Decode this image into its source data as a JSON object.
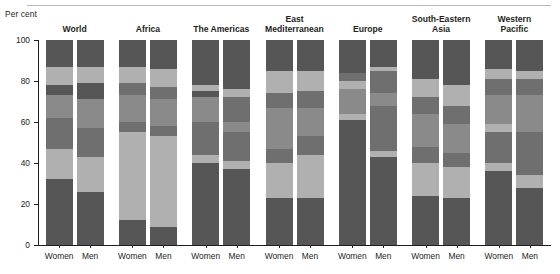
{
  "chart_data": {
    "type": "bar",
    "subtype": "stacked-column",
    "title": "",
    "xlabel": "",
    "ylabel": "Per cent",
    "ylim": [
      0,
      100
    ],
    "yticks": [
      0,
      20,
      40,
      60,
      80,
      100
    ],
    "ytick_labels": [
      "0",
      "20",
      "40",
      "60",
      "80",
      "100"
    ],
    "grid": false,
    "legend": "none",
    "colors": {
      "dark": "#565656",
      "mid_dark": "#6f6f6f",
      "mid": "#8a8a8a",
      "light": "#b0b0b0",
      "axis": "#231f20",
      "rule": "#b9b9b9",
      "background": "#ffffff"
    },
    "categories": [
      "Women",
      "Men"
    ],
    "groups": [
      {
        "name": "World",
        "bars": [
          {
            "label": "Women",
            "segments": [
              {
                "value": 32,
                "shade": "dark"
              },
              {
                "value": 15,
                "shade": "light"
              },
              {
                "value": 15,
                "shade": "mid_dark"
              },
              {
                "value": 11,
                "shade": "mid"
              },
              {
                "value": 5,
                "shade": "dark"
              },
              {
                "value": 9,
                "shade": "light"
              },
              {
                "value": 13,
                "shade": "dark"
              }
            ]
          },
          {
            "label": "Men",
            "segments": [
              {
                "value": 26,
                "shade": "dark"
              },
              {
                "value": 17,
                "shade": "light"
              },
              {
                "value": 14,
                "shade": "mid_dark"
              },
              {
                "value": 14,
                "shade": "mid"
              },
              {
                "value": 8,
                "shade": "dark"
              },
              {
                "value": 8,
                "shade": "light"
              },
              {
                "value": 13,
                "shade": "dark"
              }
            ]
          }
        ]
      },
      {
        "name": "Africa",
        "bars": [
          {
            "label": "Women",
            "segments": [
              {
                "value": 12,
                "shade": "dark"
              },
              {
                "value": 43,
                "shade": "light"
              },
              {
                "value": 5,
                "shade": "mid_dark"
              },
              {
                "value": 13,
                "shade": "mid"
              },
              {
                "value": 6,
                "shade": "mid_dark"
              },
              {
                "value": 8,
                "shade": "light"
              },
              {
                "value": 13,
                "shade": "dark"
              }
            ]
          },
          {
            "label": "Men",
            "segments": [
              {
                "value": 9,
                "shade": "dark"
              },
              {
                "value": 44,
                "shade": "light"
              },
              {
                "value": 5,
                "shade": "mid_dark"
              },
              {
                "value": 13,
                "shade": "mid"
              },
              {
                "value": 6,
                "shade": "mid_dark"
              },
              {
                "value": 9,
                "shade": "light"
              },
              {
                "value": 14,
                "shade": "dark"
              }
            ]
          }
        ]
      },
      {
        "name": "The Americas",
        "bars": [
          {
            "label": "Women",
            "segments": [
              {
                "value": 40,
                "shade": "dark"
              },
              {
                "value": 4,
                "shade": "light"
              },
              {
                "value": 16,
                "shade": "mid_dark"
              },
              {
                "value": 12,
                "shade": "mid"
              },
              {
                "value": 3,
                "shade": "dark"
              },
              {
                "value": 3,
                "shade": "light"
              },
              {
                "value": 22,
                "shade": "dark"
              }
            ]
          },
          {
            "label": "Men",
            "segments": [
              {
                "value": 37,
                "shade": "dark"
              },
              {
                "value": 4,
                "shade": "light"
              },
              {
                "value": 14,
                "shade": "mid_dark"
              },
              {
                "value": 5,
                "shade": "mid"
              },
              {
                "value": 12,
                "shade": "mid_dark"
              },
              {
                "value": 4,
                "shade": "light"
              },
              {
                "value": 24,
                "shade": "dark"
              }
            ]
          }
        ]
      },
      {
        "name": "East\nMediterranean",
        "bars": [
          {
            "label": "Women",
            "segments": [
              {
                "value": 23,
                "shade": "dark"
              },
              {
                "value": 17,
                "shade": "light"
              },
              {
                "value": 7,
                "shade": "mid_dark"
              },
              {
                "value": 20,
                "shade": "mid"
              },
              {
                "value": 7,
                "shade": "mid_dark"
              },
              {
                "value": 11,
                "shade": "light"
              },
              {
                "value": 15,
                "shade": "dark"
              }
            ]
          },
          {
            "label": "Men",
            "segments": [
              {
                "value": 23,
                "shade": "dark"
              },
              {
                "value": 21,
                "shade": "light"
              },
              {
                "value": 9,
                "shade": "mid_dark"
              },
              {
                "value": 14,
                "shade": "mid"
              },
              {
                "value": 8,
                "shade": "mid_dark"
              },
              {
                "value": 10,
                "shade": "light"
              },
              {
                "value": 15,
                "shade": "dark"
              }
            ]
          }
        ]
      },
      {
        "name": "Europe",
        "bars": [
          {
            "label": "Women",
            "segments": [
              {
                "value": 61,
                "shade": "dark"
              },
              {
                "value": 3,
                "shade": "light"
              },
              {
                "value": 12,
                "shade": "mid"
              },
              {
                "value": 4,
                "shade": "light"
              },
              {
                "value": 4,
                "shade": "mid_dark"
              },
              {
                "value": 16,
                "shade": "dark"
              }
            ]
          },
          {
            "label": "Men",
            "segments": [
              {
                "value": 43,
                "shade": "dark"
              },
              {
                "value": 3,
                "shade": "light"
              },
              {
                "value": 22,
                "shade": "mid_dark"
              },
              {
                "value": 6,
                "shade": "mid"
              },
              {
                "value": 11,
                "shade": "mid_dark"
              },
              {
                "value": 2,
                "shade": "light"
              },
              {
                "value": 13,
                "shade": "dark"
              }
            ]
          }
        ]
      },
      {
        "name": "South-Eastern\nAsia",
        "bars": [
          {
            "label": "Women",
            "segments": [
              {
                "value": 24,
                "shade": "dark"
              },
              {
                "value": 16,
                "shade": "light"
              },
              {
                "value": 8,
                "shade": "mid_dark"
              },
              {
                "value": 16,
                "shade": "mid"
              },
              {
                "value": 8,
                "shade": "mid_dark"
              },
              {
                "value": 9,
                "shade": "light"
              },
              {
                "value": 19,
                "shade": "dark"
              }
            ]
          },
          {
            "label": "Men",
            "segments": [
              {
                "value": 23,
                "shade": "dark"
              },
              {
                "value": 15,
                "shade": "light"
              },
              {
                "value": 7,
                "shade": "mid_dark"
              },
              {
                "value": 14,
                "shade": "mid"
              },
              {
                "value": 9,
                "shade": "mid_dark"
              },
              {
                "value": 10,
                "shade": "light"
              },
              {
                "value": 22,
                "shade": "dark"
              }
            ]
          }
        ]
      },
      {
        "name": "Western\nPacific",
        "bars": [
          {
            "label": "Women",
            "segments": [
              {
                "value": 36,
                "shade": "dark"
              },
              {
                "value": 4,
                "shade": "light"
              },
              {
                "value": 15,
                "shade": "mid_dark"
              },
              {
                "value": 4,
                "shade": "light"
              },
              {
                "value": 14,
                "shade": "mid"
              },
              {
                "value": 8,
                "shade": "mid_dark"
              },
              {
                "value": 5,
                "shade": "light"
              },
              {
                "value": 14,
                "shade": "dark"
              }
            ]
          },
          {
            "label": "Men",
            "segments": [
              {
                "value": 28,
                "shade": "dark"
              },
              {
                "value": 6,
                "shade": "light"
              },
              {
                "value": 21,
                "shade": "mid_dark"
              },
              {
                "value": 18,
                "shade": "mid"
              },
              {
                "value": 8,
                "shade": "mid_dark"
              },
              {
                "value": 4,
                "shade": "light"
              },
              {
                "value": 15,
                "shade": "dark"
              }
            ]
          }
        ]
      }
    ]
  }
}
